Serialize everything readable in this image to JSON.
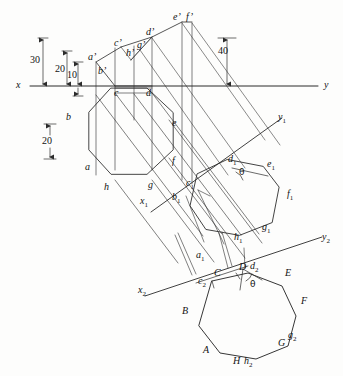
{
  "figure": {
    "type": "engineering-line-drawing",
    "ink_color": "#2b2b2b",
    "background_color": "#fdfdfc"
  },
  "axes": [
    {
      "id": "xy",
      "left_label": "x",
      "right_label": "y"
    },
    {
      "id": "x1y1",
      "left_label": "x",
      "left_sub": "1",
      "right_label": "y",
      "right_sub": "1"
    },
    {
      "id": "x2y2",
      "left_label": "x",
      "left_sub": "2",
      "right_label": "y",
      "right_sub": "2"
    }
  ],
  "dimensions": [
    {
      "value": "30",
      "orientation": "vertical"
    },
    {
      "value": "20",
      "orientation": "vertical"
    },
    {
      "value": "10",
      "orientation": "vertical"
    },
    {
      "value": "40",
      "orientation": "vertical"
    },
    {
      "value": "20",
      "orientation": "vertical"
    }
  ],
  "angles": [
    {
      "symbol": "θ",
      "view": "auxiliary-1"
    },
    {
      "symbol": "θ",
      "view": "auxiliary-2"
    }
  ],
  "views": {
    "front": {
      "name": "front-view",
      "labels": [
        {
          "text": "a",
          "prime": true
        },
        {
          "text": "b",
          "prime": true
        },
        {
          "text": "c",
          "prime": true
        },
        {
          "text": "d",
          "prime": true
        },
        {
          "text": "e",
          "prime": true
        },
        {
          "text": "f",
          "prime": true
        },
        {
          "text": "g",
          "prime": true
        },
        {
          "text": "h",
          "prime": true
        }
      ]
    },
    "top": {
      "name": "top-view",
      "labels": [
        {
          "text": "a"
        },
        {
          "text": "b"
        },
        {
          "text": "c"
        },
        {
          "text": "d"
        },
        {
          "text": "e"
        },
        {
          "text": "f"
        },
        {
          "text": "g"
        },
        {
          "text": "h"
        }
      ]
    },
    "auxiliary1": {
      "name": "first-auxiliary-view",
      "labels": [
        {
          "text": "a",
          "sub": "1"
        },
        {
          "text": "b",
          "sub": "1"
        },
        {
          "text": "c",
          "sub": "1"
        },
        {
          "text": "d",
          "sub": "1"
        },
        {
          "text": "e",
          "sub": "1"
        },
        {
          "text": "f",
          "sub": "1"
        },
        {
          "text": "g",
          "sub": "1"
        },
        {
          "text": "h",
          "sub": "1"
        }
      ]
    },
    "auxiliary2": {
      "name": "second-auxiliary-view",
      "labels": [
        {
          "text": "A"
        },
        {
          "text": "B"
        },
        {
          "text": "C"
        },
        {
          "text": "D"
        },
        {
          "text": "E"
        },
        {
          "text": "F"
        },
        {
          "text": "G"
        },
        {
          "text": "H"
        },
        {
          "text": "c",
          "sub": "2"
        },
        {
          "text": "d",
          "sub": "2"
        },
        {
          "text": "g",
          "sub": "2"
        },
        {
          "text": "h",
          "sub": "2"
        }
      ]
    }
  },
  "text_items": {
    "d30": "30",
    "d20a": "20",
    "d10": "10",
    "d40": "40",
    "d20b": "20",
    "x": "x",
    "y": "y",
    "x1": "x",
    "x1s": "1",
    "y1": "y",
    "y1s": "1",
    "x2": "x",
    "x2s": "2",
    "y2": "y",
    "y2s": "2",
    "ap": "a’",
    "bp": "b’",
    "cp": "c’",
    "dp": "d’",
    "ep": "e’",
    "fp": "f’",
    "gp": "g’",
    "hp": "h’",
    "a": "a",
    "b": "b",
    "c": "c",
    "d": "d",
    "e": "e",
    "f": "f",
    "g": "g",
    "h": "h",
    "a1": "a",
    "b1": "b",
    "c1": "c",
    "d1": "d",
    "e1": "e",
    "f1": "f",
    "g1": "g",
    "h1": "h",
    "s1": "1",
    "A": "A",
    "B": "B",
    "C": "C",
    "D": "D",
    "E": "E",
    "F": "F",
    "G": "G",
    "H": "H",
    "c2": "c",
    "d2": "d",
    "g2": "g",
    "h2": "h",
    "s2": "2",
    "theta1": "θ",
    "theta2": "θ"
  }
}
